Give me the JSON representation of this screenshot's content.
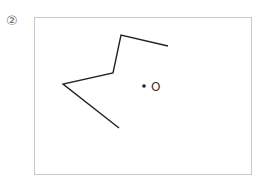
{
  "problem": {
    "number_label": "②"
  },
  "figure": {
    "polyline_points": [
      [
        168,
        46
      ],
      [
        121,
        35
      ],
      [
        113,
        73
      ],
      [
        63,
        84
      ],
      [
        119,
        128
      ]
    ],
    "point": {
      "x": 144,
      "y": 86,
      "label": "O"
    },
    "stroke_color": "#222222",
    "frame_color": "#c8c8c8"
  }
}
